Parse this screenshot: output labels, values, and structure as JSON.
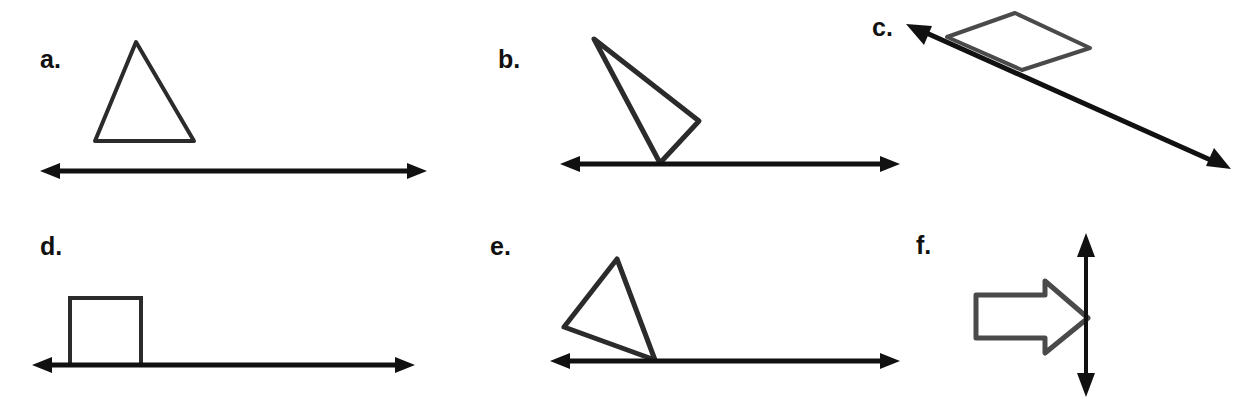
{
  "worksheet": {
    "title": "Reflection symmetry figures worksheet",
    "background_color": "#ffffff",
    "ink_color": "#1a1a1a",
    "width": 1251,
    "height": 410
  },
  "panels": [
    {
      "id": "a",
      "label": "a.",
      "figure": "triangle",
      "figure_description": "upright isosceles triangle above a horizontal double-headed arrow line, not touching the line",
      "line": "horizontal-double-arrow",
      "touching_line": false
    },
    {
      "id": "b",
      "label": "b.",
      "figure": "scalene-triangle",
      "figure_description": "slanted thin triangle with its bottom vertex resting on the horizontal double-headed arrow line",
      "line": "horizontal-double-arrow",
      "touching_line": true
    },
    {
      "id": "c",
      "label": "c.",
      "figure": "parallelogram",
      "figure_description": "parallelogram resting on a diagonal double-headed arrow line running from upper-left to lower-right",
      "line": "diagonal-double-arrow",
      "touching_line": true
    },
    {
      "id": "d",
      "label": "d.",
      "figure": "square",
      "figure_description": "square sitting on a horizontal double-headed arrow line",
      "line": "horizontal-double-arrow",
      "touching_line": true
    },
    {
      "id": "e",
      "label": "e.",
      "figure": "scalene-triangle",
      "figure_description": "tilted triangle with its lower-right vertex touching the horizontal double-headed arrow line",
      "line": "horizontal-double-arrow",
      "touching_line": true
    },
    {
      "id": "f",
      "label": "f.",
      "figure": "block-arrow-right",
      "figure_description": "hollow right-pointing block arrow with a vertical double-headed arrow line through its tip",
      "line": "vertical-double-arrow",
      "touching_line": true
    }
  ]
}
